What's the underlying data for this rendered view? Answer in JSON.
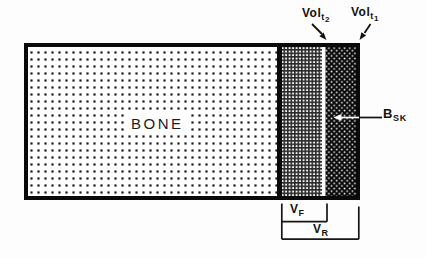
{
  "colors": {
    "ink": "#111111",
    "paper": "#ffffff",
    "dark_strip": "#0a0a0a"
  },
  "bone_label": "BONE",
  "annotations": {
    "vol_t2": {
      "main": "Vol",
      "sub": "t",
      "subsub": "2"
    },
    "vol_t1": {
      "main": "Vol",
      "sub": "t",
      "subsub": "1"
    },
    "b_sk": {
      "main": "B",
      "sub": "SK"
    },
    "v_f": {
      "main": "V",
      "sub": "F"
    },
    "v_r": {
      "main": "V",
      "sub": "R"
    }
  },
  "patterns": {
    "bone_region": "sparse-square-dots",
    "vf_strip": "fine-grid-mesh",
    "vr_strip": "black-with-white-stipple"
  }
}
